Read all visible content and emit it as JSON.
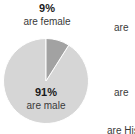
{
  "chart_data": {
    "type": "pie",
    "title": "",
    "categories": [
      "are male",
      "are female"
    ],
    "values": [
      91,
      9
    ],
    "labels": [
      "91%",
      "9%"
    ],
    "series": [
      {
        "name": "gender",
        "values": [
          91,
          9
        ]
      }
    ],
    "units": "percent",
    "legend": "none",
    "grid": false,
    "colors": [
      "#d6d6d6",
      "#a2a2a2"
    ],
    "start_angle_deg": 0,
    "direction": "counterclockwise",
    "slices": [
      {
        "label": "are male",
        "percent_text": "91%",
        "value": 91,
        "color": "#d6d6d6",
        "label_position": "inside"
      },
      {
        "label": "are female",
        "percent_text": "9%",
        "value": 9,
        "color": "#a2a2a2",
        "label_position": "above"
      }
    ]
  },
  "callouts": {
    "female": {
      "percent": "9%",
      "caption": "are female"
    },
    "male": {
      "percent": "91%",
      "caption": "are male"
    }
  },
  "edge_fragments": [
    {
      "text": "are"
    },
    {
      "text": "are"
    },
    {
      "text": "are His"
    }
  ],
  "colors": {
    "background": "#ffffff",
    "slice_major": "#d6d6d6",
    "slice_minor": "#a2a2a2",
    "slice_edge": "#ffffff",
    "text_bold": "#1a1a1a",
    "text_regular": "#3a3a3a"
  }
}
